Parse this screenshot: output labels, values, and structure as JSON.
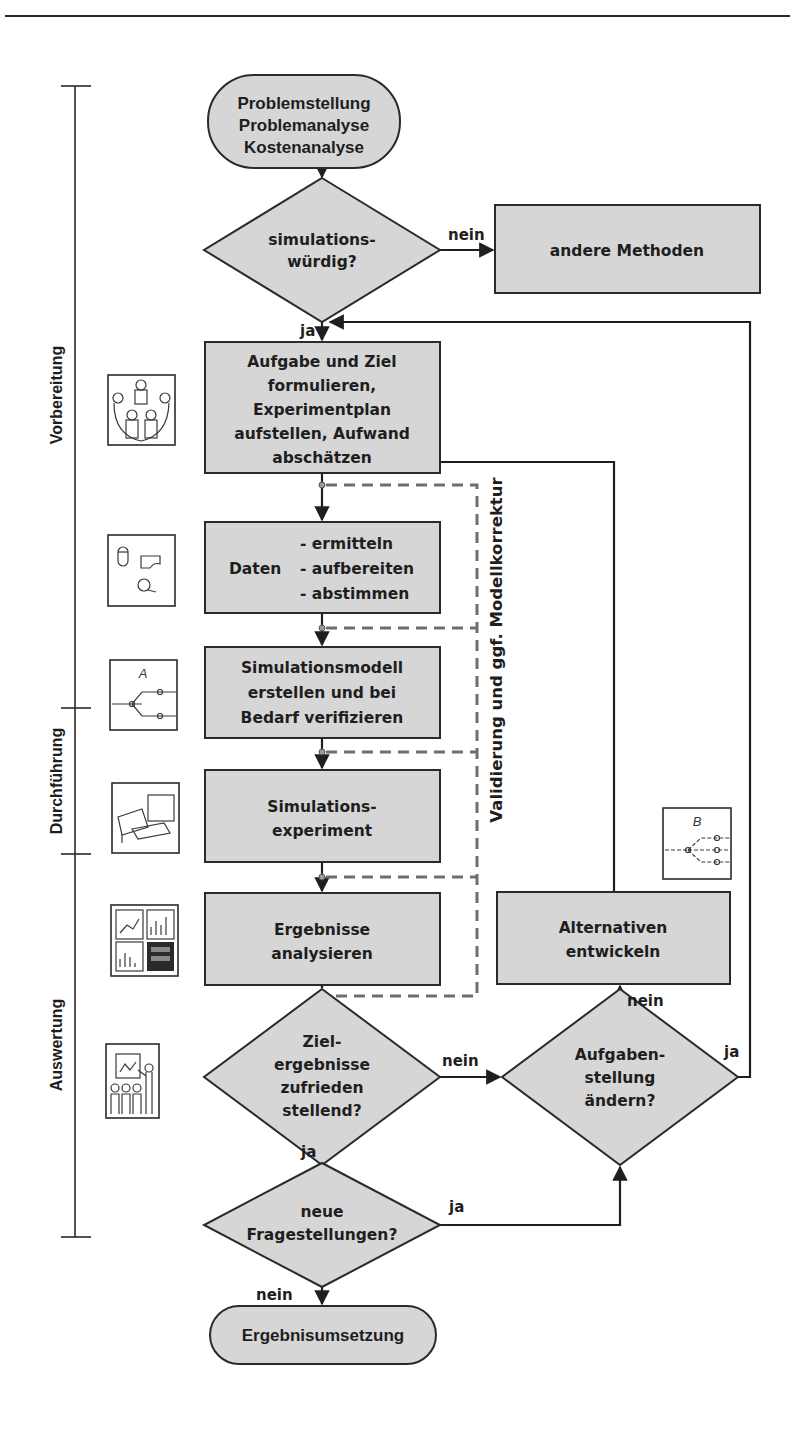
{
  "diagram": {
    "colors": {
      "node_fill": "#d6d6d6",
      "stroke": "#1f1f1f",
      "dashed_loop": "#6e6e6e",
      "background": "#ffffff"
    },
    "phases": [
      {
        "label": "Vorbereitung"
      },
      {
        "label": "Durchführung"
      },
      {
        "label": "Auswertung"
      }
    ],
    "nodes": {
      "start": {
        "lines": [
          "Problemstellung",
          "Problemanalyse",
          "Kostenanalyse"
        ]
      },
      "decision_worthy": {
        "lines": [
          "simulations-",
          "würdig?"
        ]
      },
      "other_methods": {
        "lines": [
          "andere Methoden"
        ]
      },
      "define_task": {
        "lines": [
          "Aufgabe und Ziel",
          "formulieren,",
          "Experimentplan",
          "aufstellen, Aufwand",
          "abschätzen"
        ]
      },
      "data": {
        "left": "Daten",
        "lines": [
          "- ermitteln",
          "- aufbereiten",
          "- abstimmen"
        ]
      },
      "model": {
        "lines": [
          "Simulationsmodell",
          "erstellen und bei",
          "Bedarf verifizieren"
        ]
      },
      "experiment": {
        "lines": [
          "Simulations-",
          "experiment"
        ]
      },
      "analyze": {
        "lines": [
          "Ergebnisse",
          "analysieren"
        ]
      },
      "decision_satisfying": {
        "lines": [
          "Ziel-",
          "ergebnisse",
          "zufrieden",
          "stellend?"
        ]
      },
      "decision_change_task": {
        "lines": [
          "Aufgaben-",
          "stellung",
          "ändern?"
        ]
      },
      "alternatives": {
        "lines": [
          "Alternativen",
          "entwickeln"
        ]
      },
      "decision_new_questions": {
        "lines": [
          "neue",
          "Fragestellungen?"
        ]
      },
      "end": {
        "lines": [
          "Ergebnisumsetzung"
        ]
      }
    },
    "edge_labels": {
      "worthy_no": "nein",
      "worthy_yes": "ja",
      "satisfying_no": "nein",
      "satisfying_yes": "ja",
      "change_no": "nein",
      "change_yes": "ja",
      "new_questions_yes": "ja",
      "new_questions_no": "nein"
    },
    "validation_loop_label": "Validierung und ggf. Modellkorrektur",
    "icons": [
      {
        "name": "meeting-people-icon"
      },
      {
        "name": "data-objects-icon"
      },
      {
        "name": "model-graph-a-icon",
        "letter": "A"
      },
      {
        "name": "computer-workstation-icon"
      },
      {
        "name": "charts-analysis-icon"
      },
      {
        "name": "presentation-icon"
      },
      {
        "name": "model-graph-b-icon",
        "letter": "B"
      }
    ]
  }
}
